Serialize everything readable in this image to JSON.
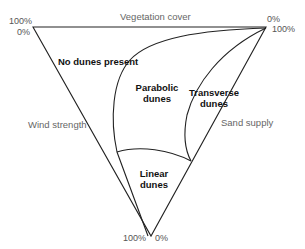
{
  "diagram": {
    "type": "ternary-triangle",
    "axes": {
      "top": "Vegetation cover",
      "left": "Wind strength",
      "right": "Sand supply"
    },
    "vertices": {
      "top_left": {
        "upper": "100%",
        "lower": "0%"
      },
      "top_right": {
        "upper": "0%",
        "lower": "100%"
      },
      "bottom": {
        "left": "100%",
        "right": "0%"
      }
    },
    "regions": {
      "none": "No dunes present",
      "parabolic_1": "Parabolic",
      "parabolic_2": "dunes",
      "transverse_1": "Transverse",
      "transverse_2": "dunes",
      "linear_1": "Linear",
      "linear_2": "dunes"
    },
    "colors": {
      "line": "#222222",
      "axis_text": "#666666",
      "region_text": "#111111"
    }
  }
}
